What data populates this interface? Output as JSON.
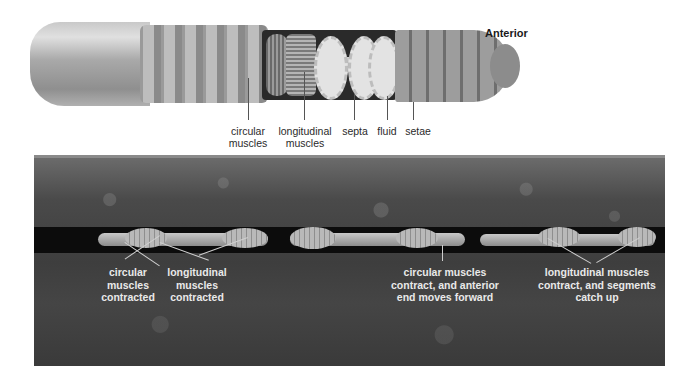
{
  "top_figure": {
    "orientation_label": "Anterior",
    "labels": [
      {
        "id": "circular-muscles",
        "text": [
          "circular",
          "muscles"
        ]
      },
      {
        "id": "longitudinal-muscles",
        "text": [
          "longitudinal",
          "muscles"
        ]
      },
      {
        "id": "septa",
        "text": [
          "septa"
        ]
      },
      {
        "id": "fluid",
        "text": [
          "fluid"
        ]
      },
      {
        "id": "setae",
        "text": [
          "setae"
        ]
      }
    ]
  },
  "bottom_figure": {
    "labels": [
      {
        "id": "circular-contracted",
        "text": [
          "circular",
          "muscles",
          "contracted"
        ]
      },
      {
        "id": "longitudinal-contracted",
        "text": [
          "longitudinal",
          "muscles",
          "contracted"
        ]
      },
      {
        "id": "circular-contract-forward",
        "text": [
          "circular muscles",
          "contract, and anterior",
          "end moves forward"
        ]
      },
      {
        "id": "longitudinal-contract-catchup",
        "text": [
          "longitudinal muscles",
          "contract, and segments",
          "catch up"
        ]
      }
    ]
  },
  "colors": {
    "soil": "#454545",
    "tunnel": "#0c0c0c",
    "worm": "#a8a8a8",
    "label_dark": "#2a2a2a",
    "label_light": "#e9e9e9"
  }
}
